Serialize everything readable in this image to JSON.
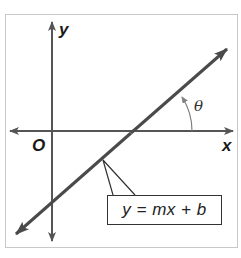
{
  "diagram": {
    "type": "coordinate-plane-line",
    "axes": {
      "x_label": "x",
      "y_label": "y",
      "origin_label": "O"
    },
    "angle": {
      "label": "θ",
      "description": "angle between positive x-axis and the line"
    },
    "line": {
      "equation": "y = mx + b"
    },
    "colors": {
      "axis": "#555555",
      "line": "#505050",
      "arc": "#808080",
      "frame": "#c8c8c8",
      "text": "#1a1a1a"
    }
  }
}
